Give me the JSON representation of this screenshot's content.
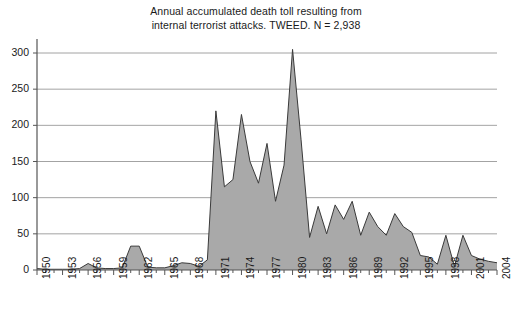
{
  "chart_data": {
    "type": "area",
    "title": "Annual accumulated death toll resulting from\ninternal terrorist attacks. TWEED. N = 2,938",
    "title_line1": "Annual accumulated death toll resulting from",
    "title_line2": "internal terrorist attacks. TWEED. N = 2,938",
    "xlabel": "",
    "ylabel": "",
    "xlim": [
      1950,
      2004
    ],
    "ylim": [
      0,
      300
    ],
    "yticks": [
      0,
      50,
      100,
      150,
      200,
      250,
      300
    ],
    "ytick_labels": [
      "0",
      "50",
      "100",
      "150",
      "200",
      "250",
      "300"
    ],
    "xtick_labels": [
      "1950",
      "1953",
      "1956",
      "1959",
      "1962",
      "1965",
      "1968",
      "1971",
      "1974",
      "1977",
      "1980",
      "1983",
      "1986",
      "1989",
      "1992",
      "1995",
      "1998",
      "2001",
      "2004"
    ],
    "xtick_step": 3,
    "grid": "horizontal",
    "legend": null,
    "fill_color": "#a9a9a9",
    "line_color": "#3a3a3a",
    "axis_color": "#555555",
    "grid_color": "#8c8c8c",
    "series": [
      {
        "name": "Deaths per year",
        "x": [
          1950,
          1951,
          1952,
          1953,
          1954,
          1955,
          1956,
          1957,
          1958,
          1959,
          1960,
          1961,
          1962,
          1963,
          1964,
          1965,
          1966,
          1967,
          1968,
          1969,
          1970,
          1971,
          1972,
          1973,
          1974,
          1975,
          1976,
          1977,
          1978,
          1979,
          1980,
          1981,
          1982,
          1983,
          1984,
          1985,
          1986,
          1987,
          1988,
          1989,
          1990,
          1991,
          1992,
          1993,
          1994,
          1995,
          1996,
          1997,
          1998,
          1999,
          2000,
          2001,
          2002,
          2003,
          2004
        ],
        "values": [
          2,
          1,
          1,
          1,
          1,
          2,
          9,
          3,
          2,
          2,
          3,
          33,
          33,
          4,
          3,
          3,
          6,
          10,
          9,
          5,
          14,
          220,
          115,
          125,
          215,
          150,
          120,
          175,
          95,
          145,
          305,
          180,
          45,
          88,
          50,
          90,
          70,
          95,
          48,
          80,
          60,
          48,
          78,
          60,
          52,
          20,
          18,
          8,
          48,
          5,
          48,
          20,
          15,
          12,
          10
        ]
      }
    ]
  },
  "geometry": {
    "plot_left": 37,
    "plot_right": 497,
    "plot_top": 53,
    "plot_bottom": 270
  }
}
